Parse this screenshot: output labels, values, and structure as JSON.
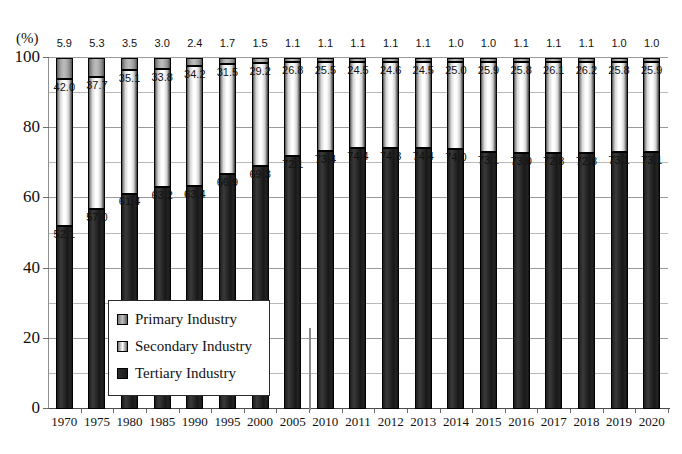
{
  "chart_data": {
    "type": "bar",
    "title": "",
    "subtitle": "",
    "xlabel": "",
    "ylabel": "(%)",
    "unit_label": "(%)",
    "stacked": true,
    "stack_total": 100,
    "grid": true,
    "grid_minor_step": 10,
    "legend_position": "inside-bottom-left",
    "ylim": [
      0,
      100
    ],
    "ytick_labels": [
      "0",
      "20",
      "40",
      "60",
      "80",
      "100"
    ],
    "ytick_values": [
      0,
      20,
      40,
      60,
      80,
      100
    ],
    "categories": [
      "1970",
      "1975",
      "1980",
      "1985",
      "1990",
      "1995",
      "2000",
      "2005",
      "2010",
      "2011",
      "2012",
      "2013",
      "2014",
      "2015",
      "2016",
      "2017",
      "2018",
      "2019",
      "2020"
    ],
    "series": [
      {
        "name": "Primary Industry",
        "color": "#b0b0b0",
        "values": [
          5.9,
          5.3,
          3.5,
          3.0,
          2.4,
          1.7,
          1.5,
          1.1,
          1.1,
          1.1,
          1.1,
          1.1,
          1.0,
          1.0,
          1.1,
          1.1,
          1.1,
          1.0,
          1.0
        ],
        "labels": [
          "5.9",
          "5.3",
          "3.5",
          "3.0",
          "2.4",
          "1.7",
          "1.5",
          "1.1",
          "1.1",
          "1.1",
          "1.1",
          "1.1",
          "1.0",
          "1.0",
          "1.1",
          "1.1",
          "1.1",
          "1.0",
          "1.0"
        ]
      },
      {
        "name": "Secondary Industry",
        "color": "#ffffff",
        "values": [
          42.0,
          37.7,
          35.1,
          33.8,
          34.2,
          31.5,
          29.2,
          26.8,
          25.5,
          24.5,
          24.6,
          24.5,
          25.0,
          25.9,
          25.8,
          26.1,
          26.2,
          25.8,
          25.9
        ],
        "labels": [
          "42.0",
          "37.7",
          "35.1",
          "33.8",
          "34.2",
          "31.5",
          "29.2",
          "26.8",
          "25.5",
          "24.5",
          "24.6",
          "24.5",
          "25.0",
          "25.9",
          "25.8",
          "26.1",
          "26.2",
          "25.8",
          "25.9"
        ]
      },
      {
        "name": "Tertiary Industry",
        "color": "#1d1d1d",
        "values": [
          52.1,
          57.0,
          61.4,
          63.2,
          63.4,
          66.9,
          69.3,
          72.1,
          73.4,
          74.4,
          74.3,
          74.4,
          74.0,
          73.1,
          73.0,
          72.8,
          72.8,
          73.1,
          73.1
        ],
        "labels": [
          "52.1",
          "57.0",
          "61.4",
          "63.2",
          "63.4",
          "66.9",
          "69.3",
          "72.1",
          "73.4",
          "74.4",
          "74.3",
          "74.4",
          "74.0",
          "73.1",
          "73.0",
          "72.8",
          "72.8",
          "73.1",
          "73.1"
        ]
      }
    ],
    "annotations": [
      {
        "name": "series-break-divider",
        "between": [
          "2005",
          "2010"
        ]
      }
    ]
  },
  "legend": {
    "items": [
      {
        "label": "Primary Industry",
        "swatch": "primary-industry-swatch"
      },
      {
        "label": "Secondary Industry",
        "swatch": "secondary-industry-swatch"
      },
      {
        "label": "Tertiary Industry",
        "swatch": "tertiary-industry-swatch"
      }
    ]
  }
}
